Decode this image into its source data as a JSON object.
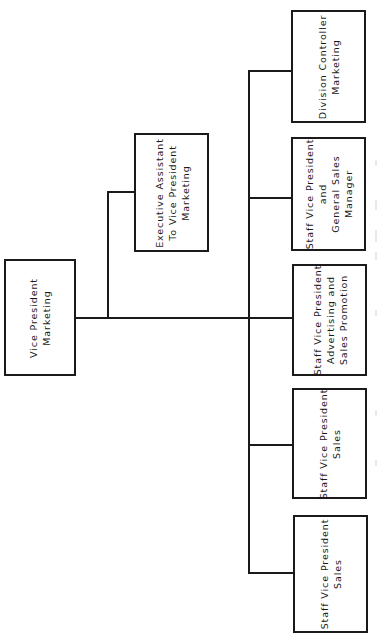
{
  "diagram": {
    "type": "org-chart",
    "orientation": "rotated-90-ccw",
    "line_color": "#1a1a1a",
    "background": "#ffffff",
    "root": {
      "id": "vp-marketing",
      "lines": [
        "Vice President",
        "Marketing"
      ],
      "box": {
        "x": 4,
        "y": 259,
        "w": 72,
        "h": 117
      }
    },
    "staff": {
      "id": "exec-assistant",
      "lines": [
        "Executive Assistant",
        "To Vice President",
        "Marketing"
      ],
      "box": {
        "x": 134,
        "y": 133,
        "w": 75,
        "h": 119
      }
    },
    "reports": [
      {
        "id": "division-controller-marketing",
        "lines": [
          "Division Controller",
          "Marketing"
        ],
        "box": {
          "x": 291,
          "y": 10,
          "w": 75,
          "h": 113
        },
        "connector_y": 71
      },
      {
        "id": "staff-vp-general-sales-manager",
        "lines": [
          "Staff Vice President",
          "and",
          "General Sales",
          "Manager"
        ],
        "box": {
          "x": 291,
          "y": 137,
          "w": 75,
          "h": 114
        },
        "connector_y": 198
      },
      {
        "id": "staff-vp-advertising-sales-promotion",
        "lines": [
          "Staff Vice President",
          "Advertising and",
          "Sales Promotion"
        ],
        "box": {
          "x": 292,
          "y": 264,
          "w": 75,
          "h": 112
        },
        "connector_y": 318
      },
      {
        "id": "staff-vp-sales-1",
        "lines": [
          "Staff Vice President",
          "Sales"
        ],
        "box": {
          "x": 292,
          "y": 388,
          "w": 75,
          "h": 111
        },
        "connector_y": 445
      },
      {
        "id": "staff-vp-sales-2",
        "lines": [
          "Staff Vice President",
          "Sales"
        ],
        "box": {
          "x": 293,
          "y": 515,
          "w": 75,
          "h": 118
        },
        "connector_y": 573
      }
    ],
    "connectors": {
      "main_y": 318,
      "main_x_start": 76,
      "bus_x": 249,
      "bus_y_top": 71,
      "bus_y_bottom": 573,
      "staff_branch_x": 108,
      "staff_branch_y": 192
    }
  }
}
